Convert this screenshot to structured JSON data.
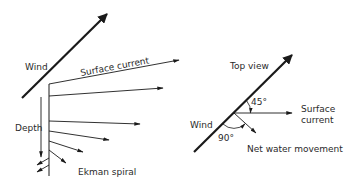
{
  "colors": {
    "ink": "#1a1a1a",
    "text": "#2a2a2a",
    "background": "#ffffff"
  },
  "left_panel": {
    "wind_label": "Wind",
    "surface_current_label": "Surface current",
    "depth_label": "Depth",
    "caption": "Ekman spiral"
  },
  "right_panel": {
    "top_view_label": "Top view",
    "wind_label": "Wind",
    "angle_current_label": "45°",
    "angle_net_label": "90°",
    "surface_current_label_line1": "Surface",
    "surface_current_label_line2": "current",
    "net_movement_label": "Net water movement"
  }
}
